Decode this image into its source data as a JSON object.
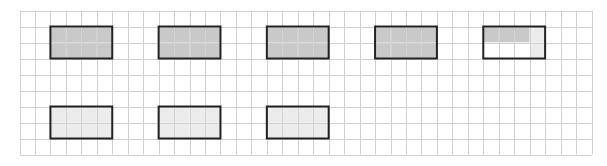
{
  "diagram": {
    "grid": {
      "columns": 37,
      "rows": 9
    },
    "colors": {
      "grid_line": "#d2d2d2",
      "border": "#222222",
      "shaded_dark": "#c9c9c9",
      "shaded_light": "#ececec",
      "unshaded": "#ffffff"
    },
    "rectangles": [
      {
        "name": "whole-1",
        "col": 2,
        "row": 1,
        "cells": [
          [
            "dark",
            "dark",
            "dark",
            "dark"
          ],
          [
            "dark",
            "dark",
            "dark",
            "dark"
          ]
        ]
      },
      {
        "name": "whole-2",
        "col": 9,
        "row": 1,
        "cells": [
          [
            "dark",
            "dark",
            "dark",
            "dark"
          ],
          [
            "dark",
            "dark",
            "dark",
            "dark"
          ]
        ]
      },
      {
        "name": "whole-3",
        "col": 16,
        "row": 1,
        "cells": [
          [
            "dark",
            "dark",
            "dark",
            "dark"
          ],
          [
            "dark",
            "dark",
            "dark",
            "dark"
          ]
        ]
      },
      {
        "name": "whole-4",
        "col": 23,
        "row": 1,
        "cells": [
          [
            "dark",
            "dark",
            "dark",
            "dark"
          ],
          [
            "dark",
            "dark",
            "dark",
            "dark"
          ]
        ]
      },
      {
        "name": "partial-5",
        "col": 30,
        "row": 1,
        "cells": [
          [
            "dark",
            "dark",
            "dark",
            "light"
          ],
          [
            "white",
            "white",
            "white",
            "light"
          ]
        ]
      },
      {
        "name": "light-1",
        "col": 2,
        "row": 6,
        "cells": [
          [
            "light",
            "light",
            "light",
            "light"
          ],
          [
            "light",
            "light",
            "light",
            "light"
          ]
        ]
      },
      {
        "name": "light-2",
        "col": 9,
        "row": 6,
        "cells": [
          [
            "light",
            "light",
            "light",
            "light"
          ],
          [
            "light",
            "light",
            "light",
            "light"
          ]
        ]
      },
      {
        "name": "light-3",
        "col": 16,
        "row": 6,
        "cells": [
          [
            "light",
            "light",
            "light",
            "light"
          ],
          [
            "light",
            "light",
            "light",
            "light"
          ]
        ]
      }
    ]
  }
}
